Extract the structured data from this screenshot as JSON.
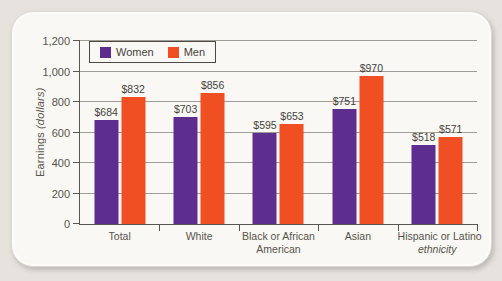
{
  "figure": {
    "y_axis_title": {
      "main": "Earnings",
      "unit": "(dollars)"
    }
  },
  "chart_data": {
    "type": "bar",
    "title": "",
    "ylabel": "Earnings (dollars)",
    "xlabel": "",
    "grid": true,
    "legend_position": "top-left-inside",
    "y_axis": {
      "min": 0,
      "max": 1200,
      "ticks": [
        {
          "value": 0,
          "label": "0"
        },
        {
          "value": 200,
          "label": "200"
        },
        {
          "value": 400,
          "label": "400"
        },
        {
          "value": 600,
          "label": "600"
        },
        {
          "value": 800,
          "label": "800"
        },
        {
          "value": 1000,
          "label": "1,000"
        },
        {
          "value": 1200,
          "label": "1,200"
        }
      ]
    },
    "categories": [
      {
        "id": "total",
        "lines": [
          {
            "text": "Total",
            "italic": false
          }
        ]
      },
      {
        "id": "white",
        "lines": [
          {
            "text": "White",
            "italic": false
          }
        ]
      },
      {
        "id": "black-or-african-american",
        "lines": [
          {
            "text": "Black or African",
            "italic": false
          },
          {
            "text": "American",
            "italic": false
          }
        ]
      },
      {
        "id": "asian",
        "lines": [
          {
            "text": "Asian",
            "italic": false
          }
        ]
      },
      {
        "id": "hispanic-or-latino",
        "lines": [
          {
            "text": "Hispanic or Latino",
            "italic": false
          },
          {
            "text": "ethnicity",
            "italic": true
          }
        ]
      }
    ],
    "series": [
      {
        "name": "Women",
        "color": "#5e2d90",
        "values": [
          684,
          703,
          595,
          751,
          518
        ],
        "labels": [
          "$684",
          "$703",
          "$595",
          "$751",
          "$518"
        ]
      },
      {
        "name": "Men",
        "color": "#f04e23",
        "values": [
          832,
          856,
          653,
          970,
          571
        ],
        "labels": [
          "$832",
          "$856",
          "$653",
          "$970",
          "$571"
        ]
      }
    ]
  },
  "colors": {
    "women": "#5e2d90",
    "men": "#f04e23",
    "card_background": "#faf8f4",
    "page_background": "#e6e3de",
    "gridline": "#a19d96",
    "axis": "#5a5750",
    "text": "#57544d"
  }
}
